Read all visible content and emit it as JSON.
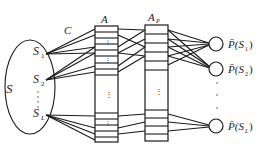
{
  "diagram": {
    "type": "network-architecture",
    "labels": {
      "set": "S",
      "connection": "C",
      "layer_a": "A",
      "layer_a_sub": "",
      "layer_ap": "A",
      "layer_ap_sub": "P",
      "vertical_dots": "⋮"
    },
    "input_nodes": [
      {
        "id": "S1",
        "main": "S",
        "sub": "1"
      },
      {
        "id": "S2",
        "main": "S",
        "sub": "2"
      },
      {
        "id": "SL",
        "main": "S",
        "sub": "L"
      }
    ],
    "output_nodes": [
      {
        "id": "out1",
        "label_main": "P̄(S",
        "label_sub": "1",
        "label_close": ")"
      },
      {
        "id": "out2",
        "label_main": "P̄(S",
        "label_sub": "2",
        "label_close": ")"
      },
      {
        "id": "outL",
        "label_main": "P̄(S",
        "label_sub": "L",
        "label_close": ")"
      }
    ],
    "colors": {
      "stroke": "#1a1a1a",
      "background": "#ffffff"
    }
  }
}
